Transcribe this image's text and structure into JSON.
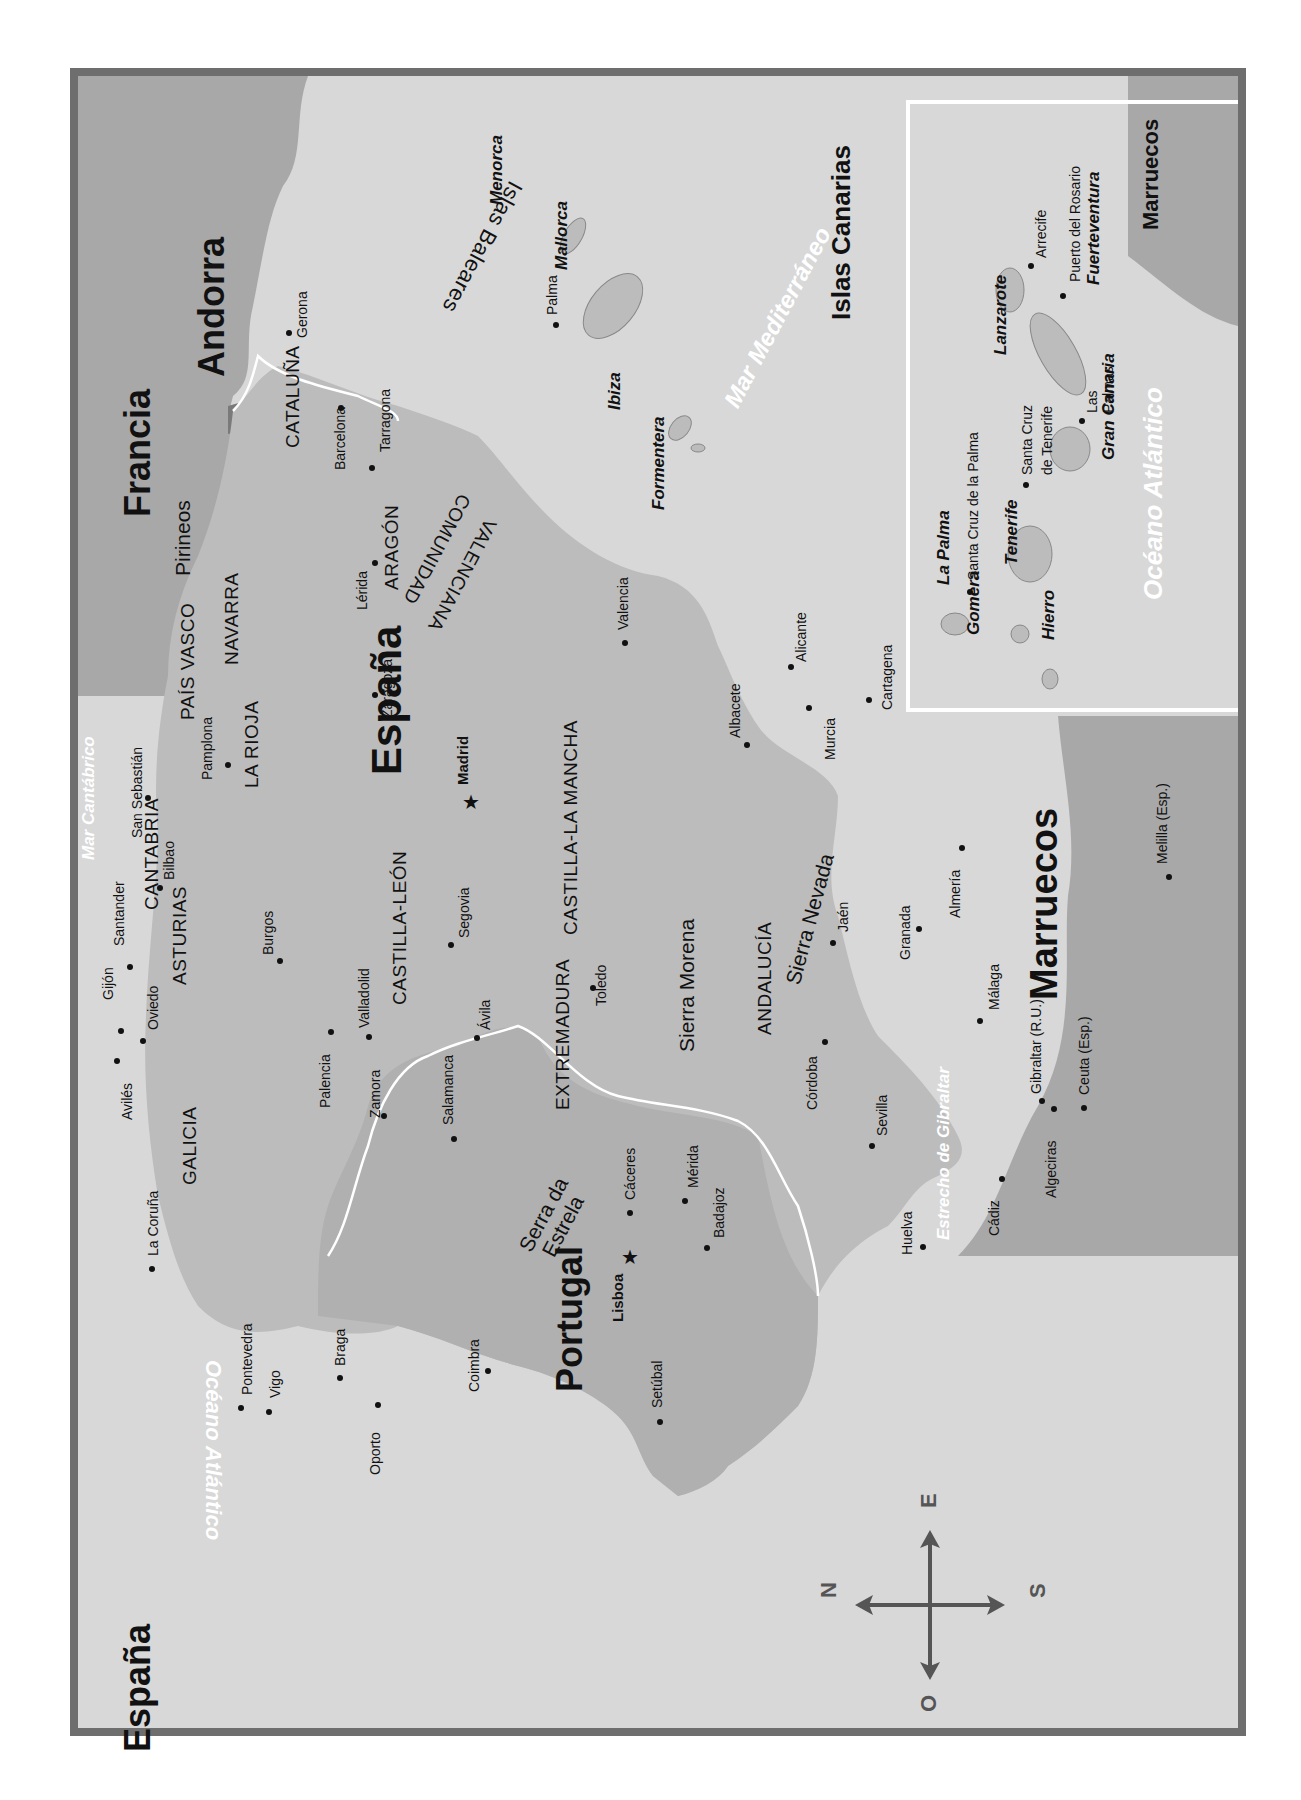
{
  "map": {
    "orientation": "rotated 90 degrees counter-clockwise (north points left)",
    "colors": {
      "frame": "#6e6e6e",
      "land_spain_portugal": "#bdbdbd",
      "foreign_land": "#a9a9a9",
      "sea": "#d8d8d8",
      "border_line": "#ffffff",
      "text": "#111111",
      "sea_label": "#ffffff"
    },
    "countries": {
      "espana_corner": "España",
      "espana_main": "España",
      "portugal": "Portugal",
      "francia": "Francia",
      "andorra": "Andorra",
      "marruecos": "Marruecos"
    },
    "seas": {
      "oceano_atlantico": "Océano Atlántico",
      "mar_cantabrico": "Mar Cantábrico",
      "mar_mediterraneo": "Mar Mediterráneo",
      "estrecho_gibraltar": "Estrecho de Gibraltar"
    },
    "regions": {
      "galicia": "GALICIA",
      "asturias": "ASTURIAS",
      "cantabria": "CANTABRIA",
      "pais_vasco": "PAÍS VASCO",
      "navarra": "NAVARRA",
      "la_rioja": "LA RIOJA",
      "aragon": "ARAGÓN",
      "cataluna": "CATALUÑA",
      "castilla_leon": "CASTILLA-LEÓN",
      "castilla_la_mancha": "CASTILLA-LA MANCHA",
      "comunidad": "COMUNIDAD",
      "valenciana": "VALENCIANA",
      "extremadura": "EXTREMADURA",
      "andalucia": "ANDALUCÍA"
    },
    "mountains": {
      "pirineos": "Pirineos",
      "sierra_morena": "Sierra Morena",
      "sierra_nevada": "Sierra Nevada",
      "serra_da": "Serra da",
      "estrela": "Estrela"
    },
    "capitals": {
      "madrid": "Madrid",
      "lisboa": "Lisboa"
    },
    "cities": {
      "la_coruna": "La Coruña",
      "aviles": "Avilés",
      "gijon": "Gijón",
      "oviedo": "Oviedo",
      "santander": "Santander",
      "bilbao": "Bilbao",
      "san_sebastian": "San Sebastián",
      "pamplona": "Pamplona",
      "gerona": "Gerona",
      "barcelona": "Barcelona",
      "tarragona": "Tarragona",
      "lerida": "Lérida",
      "zaragoza": "Zaragoza",
      "burgos": "Burgos",
      "palencia": "Palencia",
      "valladolid": "Valladolid",
      "zamora": "Zamora",
      "salamanca": "Salamanca",
      "avila": "Ávila",
      "segovia": "Segovia",
      "toledo": "Toledo",
      "valencia": "Valencia",
      "alicante": "Alicante",
      "albacete": "Albacete",
      "murcia": "Murcia",
      "cartagena": "Cartagena",
      "caceres": "Cáceres",
      "merida": "Mérida",
      "badajoz": "Badajoz",
      "cordoba": "Córdoba",
      "jaen": "Jaén",
      "granada": "Granada",
      "almeria": "Almería",
      "malaga": "Málaga",
      "sevilla": "Sevilla",
      "huelva": "Huelva",
      "cadiz": "Cádiz",
      "algeciras": "Algeciras",
      "gibraltar": "Gibraltar (R.U.)",
      "ceuta": "Ceuta (Esp.)",
      "melilla": "Melilla (Esp.)",
      "pontevedra": "Pontevedra",
      "vigo": "Vigo",
      "braga": "Braga",
      "oporto": "Oporto",
      "coimbra": "Coimbra",
      "setubal": "Setúbal",
      "palma": "Palma"
    },
    "islands": {
      "islas_baleares": "Islas Baleares",
      "menorca": "Menorca",
      "mallorca": "Mallorca",
      "ibiza": "Ibiza",
      "formentera": "Formentera"
    },
    "inset": {
      "title": "Islas Canarias",
      "islands": {
        "la_palma": "La Palma",
        "tenerife": "Tenerife",
        "gomera": "Gomera",
        "hierro": "Hierro",
        "gran_canaria": "Gran Canaria",
        "lanzarote": "Lanzarote",
        "fuerteventura": "Fuerteventura"
      },
      "cities": {
        "santa_cruz_palma": "Santa Cruz de la Palma",
        "santa_cruz_tenerife_1": "Santa Cruz",
        "santa_cruz_tenerife_2": "de Tenerife",
        "las_palmas_1": "Las",
        "las_palmas_2": "Palmas",
        "arrecife": "Arrecife",
        "puerto_rosario": "Puerto del Rosario"
      },
      "marruecos": "Marruecos",
      "ocean": "Océano Atlántico"
    },
    "compass": {
      "north": "N",
      "south": "S",
      "east": "E",
      "west": "O"
    }
  }
}
